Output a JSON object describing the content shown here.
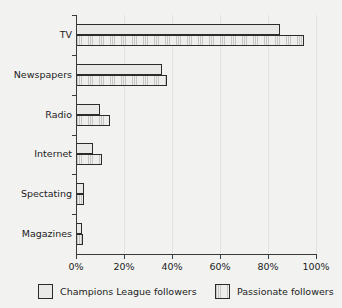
{
  "chart_data": {
    "type": "bar",
    "orientation": "horizontal",
    "title": "",
    "xlabel": "",
    "ylabel": "",
    "categories": [
      "TV",
      "Newspapers",
      "Radio",
      "Internet",
      "Spectating",
      "Magazines"
    ],
    "series": [
      {
        "name": "Champions League followers",
        "values": [
          85,
          36,
          10,
          7,
          3.5,
          2.5
        ],
        "fill": "#e9e9e7",
        "pattern": "solid"
      },
      {
        "name": "Passionate followers",
        "values": [
          95,
          38,
          14,
          11,
          3.5,
          3
        ],
        "fill": "#dcdcda",
        "pattern": "vertical-hatch"
      }
    ],
    "xlim": [
      0,
      100
    ],
    "xticks": [
      0,
      20,
      40,
      60,
      80,
      100
    ],
    "xtick_labels": [
      "0%",
      "20%",
      "40%",
      "60%",
      "80%",
      "100%"
    ],
    "grid": true,
    "grid_axis": "x",
    "legend_position": "bottom",
    "axis_color": "#3a3a3a",
    "grid_color": "#e2e2e0",
    "background": "#f2f2f0"
  }
}
